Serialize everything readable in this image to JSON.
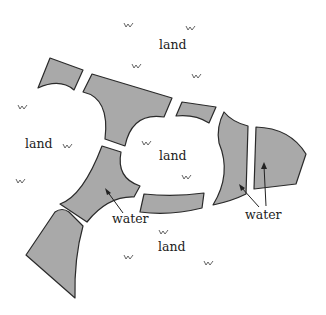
{
  "diagram": {
    "title": "",
    "fill_color": "#a9a9a9",
    "stroke_color": "#2a2a2a",
    "labels": {
      "land_top": "land",
      "land_left": "land",
      "land_center": "land",
      "land_bottom": "land",
      "water_left": "water",
      "water_right": "water"
    },
    "grass_symbol": "ᐯ",
    "grass_marks": [
      {
        "x": 128,
        "y": 26
      },
      {
        "x": 190,
        "y": 29
      },
      {
        "x": 136,
        "y": 67
      },
      {
        "x": 196,
        "y": 77
      },
      {
        "x": 22,
        "y": 108
      },
      {
        "x": 67,
        "y": 147
      },
      {
        "x": 146,
        "y": 144
      },
      {
        "x": 186,
        "y": 178
      },
      {
        "x": 20,
        "y": 182
      },
      {
        "x": 163,
        "y": 233
      },
      {
        "x": 128,
        "y": 258
      },
      {
        "x": 208,
        "y": 264
      }
    ]
  }
}
